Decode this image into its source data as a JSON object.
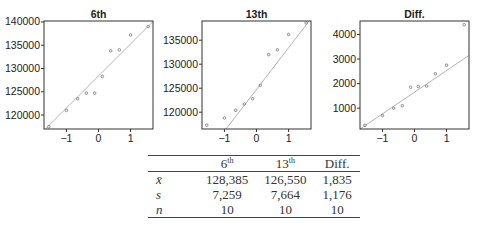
{
  "chart_data": [
    {
      "type": "scatter",
      "subtype": "normal-qq-plot",
      "title": "6th",
      "xlabel": "",
      "ylabel": "",
      "x_ticks": [
        -1,
        0,
        1
      ],
      "y_ticks": [
        120000,
        125000,
        130000,
        135000,
        140000
      ],
      "xlim": [
        -1.7,
        1.7
      ],
      "ylim": [
        117000,
        140200
      ],
      "points": {
        "x": [
          -1.55,
          -1.0,
          -0.65,
          -0.38,
          -0.12,
          0.12,
          0.38,
          0.65,
          1.0,
          1.55
        ],
        "y": [
          117500,
          121000,
          123500,
          124700,
          124700,
          128300,
          133800,
          134000,
          137200,
          139000
        ]
      },
      "reference_line": {
        "x": [
          -1.7,
          1.7
        ],
        "y": [
          116700,
          140100
        ]
      }
    },
    {
      "type": "scatter",
      "subtype": "normal-qq-plot",
      "title": "13th",
      "xlabel": "",
      "ylabel": "",
      "x_ticks": [
        -1,
        0,
        1
      ],
      "y_ticks": [
        120000,
        125000,
        130000,
        135000
      ],
      "xlim": [
        -1.7,
        1.7
      ],
      "ylim": [
        116500,
        139000
      ],
      "points": {
        "x": [
          -1.55,
          -1.0,
          -0.65,
          -0.38,
          -0.12,
          0.12,
          0.38,
          0.65,
          1.0,
          1.55
        ],
        "y": [
          117300,
          118800,
          120400,
          121700,
          122800,
          125600,
          132000,
          133000,
          136200,
          138600
        ]
      },
      "reference_line": {
        "x": [
          -0.95,
          1.7
        ],
        "y": [
          116500,
          139500
        ]
      }
    },
    {
      "type": "scatter",
      "subtype": "normal-qq-plot",
      "title": "Diff.",
      "xlabel": "",
      "ylabel": "",
      "x_ticks": [
        -1,
        0,
        1
      ],
      "y_ticks": [
        1000,
        2000,
        3000,
        4000
      ],
      "xlim": [
        -1.7,
        1.7
      ],
      "ylim": [
        150,
        4550
      ],
      "points": {
        "x": [
          -1.55,
          -1.0,
          -0.65,
          -0.38,
          -0.12,
          0.12,
          0.38,
          0.65,
          1.0,
          1.55
        ],
        "y": [
          300,
          700,
          1000,
          1100,
          1850,
          1880,
          1900,
          2400,
          2750,
          4400
        ]
      },
      "reference_line": {
        "x": [
          -1.7,
          1.7
        ],
        "y": [
          150,
          3150
        ]
      }
    }
  ],
  "table": {
    "headers": [
      {
        "base": "",
        "sup": ""
      },
      {
        "base": "6",
        "sup": "th"
      },
      {
        "base": "13",
        "sup": "th"
      },
      {
        "base": "Diff.",
        "sup": ""
      }
    ],
    "rows": [
      {
        "label": "x̄",
        "values": [
          "128,385",
          "126,550",
          "1,835"
        ]
      },
      {
        "label": "s",
        "values": [
          "7,259",
          "7,664",
          "1,176"
        ]
      },
      {
        "label": "n",
        "values": [
          "10",
          "10",
          "10"
        ]
      }
    ]
  }
}
